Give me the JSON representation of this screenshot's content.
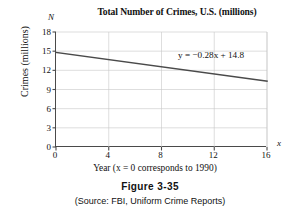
{
  "figure": {
    "caption_label": "Figure 3-35",
    "source_note": "(Source: FBI, Uniform Crime Reports)"
  },
  "axis_markers": {
    "y_variable": "N",
    "x_variable": "x"
  },
  "chart_data": {
    "type": "line",
    "title": "Total Number of Crimes, U.S. (millions)",
    "xlabel": "Year (x = 0 corresponds to 1990)",
    "ylabel": "Crimes (millions)",
    "xlim": [
      0,
      16
    ],
    "ylim": [
      0,
      18
    ],
    "xticks": [
      0,
      4,
      8,
      12,
      16
    ],
    "yticks": [
      0,
      3,
      6,
      9,
      12,
      15,
      18
    ],
    "xtick_labels": [
      "0",
      "4",
      "8",
      "12",
      "16"
    ],
    "ytick_labels": [
      "0",
      "3",
      "6",
      "9",
      "12",
      "15",
      "18"
    ],
    "grid": true,
    "legend": "none",
    "annotation": "y = −0.28x + 14.8",
    "series": [
      {
        "name": "Total crimes trend line",
        "equation": "y = -0.28x + 14.8",
        "slope": -0.28,
        "intercept": 14.8,
        "x": [
          0,
          16
        ],
        "values": [
          14.8,
          10.32
        ]
      }
    ],
    "colors": {
      "line": "#4a4a4a",
      "grid": "#c8c8c8",
      "axis": "#4a4a4a",
      "background": "#ffffff"
    }
  }
}
